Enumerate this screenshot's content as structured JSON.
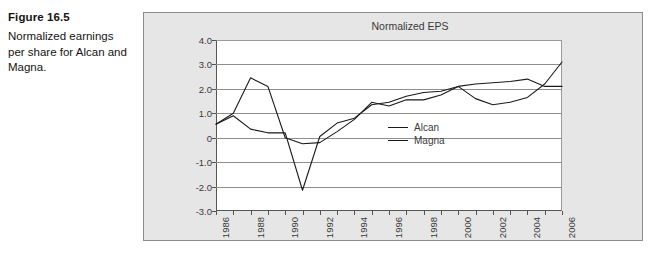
{
  "caption": {
    "figure_number": "Figure 16.5",
    "description": "Normalized earnings per share for Alcan and Magna."
  },
  "chart_data": {
    "type": "line",
    "title": "Normalized EPS",
    "xlabel": "",
    "ylabel": "",
    "xlim": [
      1986,
      2006
    ],
    "ylim": [
      -3.0,
      4.0
    ],
    "grid": true,
    "legend_position": "inside-right",
    "ytick_labels": [
      "4.0",
      "3.0",
      "2.0",
      "1.0",
      "0",
      "-1.0",
      "-2.0",
      "-3.0"
    ],
    "ytick_values": [
      4.0,
      3.0,
      2.0,
      1.0,
      0,
      -1.0,
      -2.0,
      -3.0
    ],
    "xtick_labels": [
      "1986",
      "1988",
      "1990",
      "1992",
      "1994",
      "1996",
      "1998",
      "2000",
      "2002",
      "2004",
      "2006"
    ],
    "xtick_values": [
      1986,
      1988,
      1990,
      1992,
      1994,
      1996,
      1998,
      2000,
      2002,
      2004,
      2006
    ],
    "x": [
      1986,
      1987,
      1988,
      1989,
      1990,
      1991,
      1992,
      1993,
      1994,
      1995,
      1996,
      1997,
      1998,
      1999,
      2000,
      2001,
      2002,
      2003,
      2004,
      2005,
      2006
    ],
    "series": [
      {
        "name": "Alcan",
        "color": "#1a1a1a",
        "values": [
          0.55,
          1.0,
          2.45,
          2.1,
          0.0,
          -0.25,
          -0.2,
          0.25,
          0.75,
          1.45,
          1.3,
          1.55,
          1.55,
          1.75,
          2.1,
          1.6,
          1.35,
          1.45,
          1.65,
          2.2,
          3.1
        ]
      },
      {
        "name": "Magna",
        "color": "#1a1a1a",
        "values": [
          0.55,
          0.9,
          0.35,
          0.2,
          0.2,
          -2.15,
          0.05,
          0.6,
          0.8,
          1.35,
          1.45,
          1.7,
          1.85,
          1.9,
          2.1,
          2.2,
          2.25,
          2.3,
          2.4,
          2.1,
          2.1
        ]
      }
    ],
    "legend": [
      {
        "label": "Alcan"
      },
      {
        "label": "Magna"
      }
    ]
  }
}
